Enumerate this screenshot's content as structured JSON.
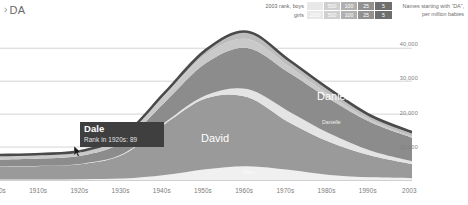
{
  "breadcrumb": {
    "chevron": "›",
    "label": "DA"
  },
  "legend": {
    "rows": [
      {
        "caption": "2003 rank, boys",
        "cells": [
          "",
          "500",
          "100",
          "25",
          "5"
        ]
      },
      {
        "caption": "girls",
        "cells": [
          "1000",
          "500",
          "100",
          "25",
          "5"
        ]
      }
    ],
    "colors": [
      "#e8e8e8",
      "#cfcfcf",
      "#b0b0b0",
      "#919191",
      "#6e6e6e"
    ]
  },
  "axis_caption": "Names starting with “DA”, per million babies",
  "chart_data": {
    "type": "area",
    "title": "Names starting with “DA”, per million babies",
    "xlabel": "",
    "ylabel": "per million babies",
    "grid": true,
    "ylim": [
      0,
      47000
    ],
    "yticks": [
      10000,
      20000,
      30000,
      40000
    ],
    "ytick_labels": [
      "10,000",
      "20,000",
      "30,000",
      "40,000"
    ],
    "categories": [
      "1900s",
      "1910s",
      "1920s",
      "1930s",
      "1940s",
      "1950s",
      "1960s",
      "1970s",
      "1980s",
      "1990s",
      "2003"
    ],
    "x_tick_labels": [
      "1900s",
      "1910s",
      "1920s",
      "1930s",
      "1940s",
      "1950s",
      "1960s",
      "1970s",
      "1980s",
      "1990s",
      "2003"
    ],
    "stacked": true,
    "total_values": [
      7600,
      7900,
      8900,
      13500,
      26500,
      39500,
      45000,
      36500,
      27500,
      19500,
      14500
    ],
    "series": [
      {
        "name": "Dawn",
        "color": "#f0f0f0",
        "values": [
          120,
          150,
          260,
          420,
          1500,
          3300,
          4200,
          3100,
          1500,
          800,
          520
        ]
      },
      {
        "name": "David",
        "color": "#9a9a9a",
        "values": [
          3900,
          4100,
          4600,
          7400,
          15500,
          21500,
          21000,
          14500,
          10000,
          6600,
          4300
        ]
      },
      {
        "name": "Danielle",
        "color": "#e4e4e4",
        "values": [
          60,
          70,
          110,
          190,
          420,
          900,
          2400,
          3300,
          2600,
          1500,
          900
        ]
      },
      {
        "name": "Daniel",
        "color": "#8c8c8c",
        "values": [
          2100,
          2200,
          2500,
          3700,
          6200,
          9800,
          12500,
          11800,
          10500,
          8600,
          7100
        ]
      },
      {
        "name": "Dale",
        "color": "#c9c9c9",
        "values": [
          860,
          930,
          1100,
          1400,
          2100,
          2600,
          2700,
          1900,
          1100,
          620,
          380
        ]
      },
      {
        "name": "other DA",
        "color": "#bdbdbd",
        "values": [
          560,
          450,
          330,
          390,
          780,
          1400,
          2200,
          1900,
          1800,
          1380,
          1300
        ]
      }
    ],
    "labels_in_chart": [
      {
        "text": "David",
        "series": "David"
      },
      {
        "text": "Daniel",
        "series": "Daniel"
      },
      {
        "text": "Danielle",
        "series": "Danielle"
      },
      {
        "text": "Dawn",
        "series": "Dawn"
      }
    ]
  },
  "tooltip": {
    "title": "Dale",
    "subtitle": "Rank in 1920s: 89"
  },
  "colors": {
    "tooltip_bg": "#3f3f3f",
    "gridline": "#c9c9c9",
    "top_outline": "#4a4a4a",
    "axis_text": "#7c7c7c"
  }
}
